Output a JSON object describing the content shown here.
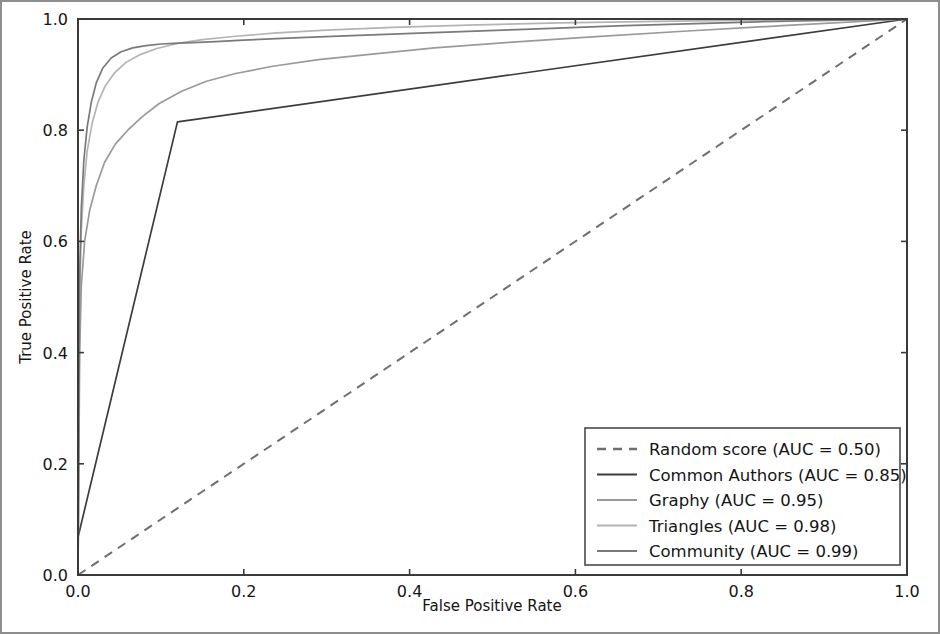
{
  "figure": {
    "background_color": "#ffffff",
    "border_color": "#8d8d8d"
  },
  "chart_data": {
    "type": "line",
    "title": "",
    "xlabel": "False Positive Rate",
    "ylabel": "True Positive Rate",
    "xlim": [
      0.0,
      1.0
    ],
    "ylim": [
      0.0,
      1.0
    ],
    "xticks": [
      "0.0",
      "0.2",
      "0.4",
      "0.6",
      "0.8",
      "1.0"
    ],
    "xtick_values": [
      0.0,
      0.2,
      0.4,
      0.6,
      0.8,
      1.0
    ],
    "yticks": [
      "0.0",
      "0.2",
      "0.4",
      "0.6",
      "0.8",
      "1.0"
    ],
    "ytick_values": [
      0.0,
      0.2,
      0.4,
      0.6,
      0.8,
      1.0
    ],
    "grid": false,
    "legend_position": "lower right",
    "series": [
      {
        "name": "Random score (AUC = 0.50)",
        "short_name": "Random score",
        "auc": 0.5,
        "color": "#6f6f6f",
        "dash": "9,7",
        "width": 2.0,
        "points": [
          [
            0.0,
            0.0
          ],
          [
            1.0,
            1.0
          ]
        ]
      },
      {
        "name": "Common Authors (AUC = 0.85)",
        "short_name": "Common Authors",
        "auc": 0.85,
        "color": "#3c3c3c",
        "dash": "none",
        "width": 1.7,
        "points": [
          [
            0.0,
            0.0
          ],
          [
            0.0,
            0.068
          ],
          [
            0.12,
            0.815
          ],
          [
            1.0,
            1.0
          ]
        ]
      },
      {
        "name": "Graphy (AUC = 0.95)",
        "short_name": "Graphy",
        "auc": 0.95,
        "color": "#9a9a9a",
        "dash": "none",
        "width": 1.7,
        "points": [
          [
            0.0,
            0.0
          ],
          [
            0.002,
            0.4
          ],
          [
            0.004,
            0.52
          ],
          [
            0.008,
            0.6
          ],
          [
            0.014,
            0.655
          ],
          [
            0.022,
            0.7
          ],
          [
            0.032,
            0.742
          ],
          [
            0.045,
            0.775
          ],
          [
            0.06,
            0.8
          ],
          [
            0.078,
            0.825
          ],
          [
            0.098,
            0.848
          ],
          [
            0.125,
            0.87
          ],
          [
            0.155,
            0.888
          ],
          [
            0.19,
            0.902
          ],
          [
            0.235,
            0.915
          ],
          [
            0.29,
            0.927
          ],
          [
            0.355,
            0.937
          ],
          [
            0.43,
            0.948
          ],
          [
            0.52,
            0.958
          ],
          [
            0.62,
            0.968
          ],
          [
            0.73,
            0.978
          ],
          [
            0.85,
            0.988
          ],
          [
            1.0,
            1.0
          ]
        ]
      },
      {
        "name": "Triangles (AUC = 0.98)",
        "short_name": "Triangles",
        "auc": 0.98,
        "color": "#b4b4b4",
        "dash": "none",
        "width": 1.7,
        "points": [
          [
            0.0,
            0.0
          ],
          [
            0.002,
            0.5
          ],
          [
            0.004,
            0.62
          ],
          [
            0.007,
            0.7
          ],
          [
            0.011,
            0.762
          ],
          [
            0.017,
            0.812
          ],
          [
            0.024,
            0.85
          ],
          [
            0.033,
            0.88
          ],
          [
            0.044,
            0.903
          ],
          [
            0.058,
            0.922
          ],
          [
            0.075,
            0.936
          ],
          [
            0.095,
            0.947
          ],
          [
            0.12,
            0.956
          ],
          [
            0.15,
            0.963
          ],
          [
            0.19,
            0.969
          ],
          [
            0.24,
            0.975
          ],
          [
            0.3,
            0.98
          ],
          [
            0.38,
            0.985
          ],
          [
            0.47,
            0.989
          ],
          [
            0.58,
            0.993
          ],
          [
            0.72,
            0.996
          ],
          [
            0.87,
            0.999
          ],
          [
            1.0,
            1.0
          ]
        ]
      },
      {
        "name": "Community (AUC = 0.99)",
        "short_name": "Community",
        "auc": 0.99,
        "color": "#7a7a7a",
        "dash": "none",
        "width": 1.7,
        "points": [
          [
            0.0,
            0.0
          ],
          [
            0.002,
            0.54
          ],
          [
            0.004,
            0.66
          ],
          [
            0.007,
            0.745
          ],
          [
            0.011,
            0.805
          ],
          [
            0.016,
            0.85
          ],
          [
            0.022,
            0.885
          ],
          [
            0.03,
            0.912
          ],
          [
            0.04,
            0.93
          ],
          [
            0.052,
            0.941
          ],
          [
            0.066,
            0.948
          ],
          [
            0.082,
            0.952
          ],
          [
            0.1,
            0.955
          ],
          [
            0.115,
            0.956
          ],
          [
            0.13,
            0.957
          ],
          [
            0.16,
            0.959
          ],
          [
            0.2,
            0.962
          ],
          [
            0.26,
            0.966
          ],
          [
            0.33,
            0.97
          ],
          [
            0.42,
            0.975
          ],
          [
            0.53,
            0.981
          ],
          [
            0.66,
            0.988
          ],
          [
            0.82,
            0.995
          ],
          [
            1.0,
            1.0
          ]
        ]
      }
    ]
  }
}
